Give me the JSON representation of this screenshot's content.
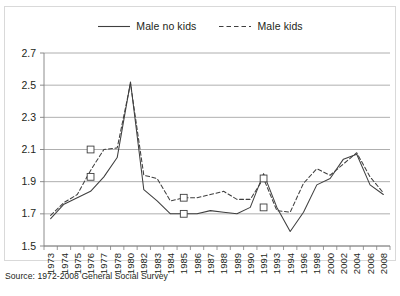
{
  "source_note": "Source: 1972-2008 General Social Survey",
  "legend": {
    "position": "top-center",
    "entries": [
      {
        "label": "Male no kids",
        "style": "solid",
        "color": "#3f3f3f"
      },
      {
        "label": "Male kids",
        "style": "dashed",
        "color": "#3f3f3f"
      }
    ]
  },
  "chart_data": {
    "type": "line",
    "title": "",
    "subtitle": "",
    "xlabel": "",
    "ylabel": "",
    "grid": true,
    "legend_position": "top-center",
    "ylim": [
      1.5,
      2.7
    ],
    "yticks": [
      1.5,
      1.7,
      1.9,
      2.1,
      2.3,
      2.5,
      2.7
    ],
    "ytick_labels": [
      "1.5",
      "1.7",
      "1.9",
      "2.1",
      "2.3",
      "2.5",
      "2.7"
    ],
    "categories": [
      "1973",
      "1974",
      "1975",
      "1976",
      "1977",
      "1978",
      "1980",
      "1982",
      "1983",
      "1984",
      "1985",
      "1986",
      "1987",
      "1988",
      "1989",
      "1990",
      "1991",
      "1993",
      "1994",
      "1996",
      "1998",
      "2000",
      "2002",
      "2004",
      "2006",
      "2008"
    ],
    "series": [
      {
        "name": "Male no kids",
        "style": "solid",
        "color": "#3f3f3f",
        "values": [
          1.67,
          1.76,
          1.8,
          1.84,
          1.93,
          2.05,
          2.52,
          1.85,
          1.78,
          1.7,
          1.7,
          1.7,
          1.72,
          1.71,
          1.7,
          1.74,
          1.95,
          1.74,
          1.59,
          1.71,
          1.88,
          1.92,
          2.04,
          2.07,
          1.88,
          1.82
        ]
      },
      {
        "name": "Male kids",
        "style": "dashed",
        "color": "#3f3f3f",
        "values": [
          1.69,
          1.77,
          1.82,
          1.97,
          2.1,
          2.11,
          2.51,
          1.94,
          1.92,
          1.78,
          1.8,
          1.8,
          1.82,
          1.84,
          1.79,
          1.79,
          1.92,
          1.72,
          1.71,
          1.89,
          1.98,
          1.94,
          2.01,
          2.08,
          1.93,
          1.83
        ]
      }
    ],
    "markers": [
      {
        "series": "Male kids",
        "category": "1976",
        "value": 2.1,
        "shape": "square"
      },
      {
        "series": "Male no kids",
        "category": "1976",
        "value": 1.93,
        "shape": "square"
      },
      {
        "series": "Male kids",
        "category": "1985",
        "value": 1.8,
        "shape": "square"
      },
      {
        "series": "Male no kids",
        "category": "1985",
        "value": 1.7,
        "shape": "square"
      },
      {
        "series": "Male kids",
        "category": "1991",
        "value": 1.92,
        "shape": "square"
      },
      {
        "series": "Male no kids",
        "category": "1991",
        "value": 1.74,
        "shape": "square"
      }
    ],
    "axis_color": "#808080",
    "grid_color": "#9a9a9a"
  }
}
